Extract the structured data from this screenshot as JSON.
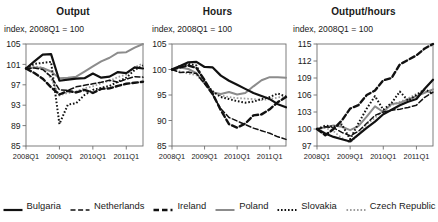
{
  "figure": {
    "subtitle_common": "index, 2008Q1 = 100",
    "xticks": [
      "2008Q1",
      "2009Q1",
      "2010Q1",
      "2011Q1"
    ]
  },
  "legend": {
    "items": [
      {
        "label": "Bulgaria",
        "style": "solid",
        "color": "#111111",
        "width": 2.2
      },
      {
        "label": "Netherlands",
        "style": "dashed",
        "color": "#111111",
        "width": 1.5
      },
      {
        "label": "Ireland",
        "style": "dashed-bold",
        "color": "#111111",
        "width": 2.4
      },
      {
        "label": "Poland",
        "style": "solid",
        "color": "#8c8c8c",
        "width": 2.0
      },
      {
        "label": "Slovakia",
        "style": "dotted",
        "color": "#111111",
        "width": 2.0
      },
      {
        "label": "Czech Republic",
        "style": "dotted",
        "color": "#9e9e9e",
        "width": 1.8
      }
    ]
  },
  "chart_data": [
    {
      "type": "line",
      "title": "Output",
      "subtitle": "index, 2008Q1 = 100",
      "xlabel": "",
      "ylabel": "",
      "ylim": [
        85,
        105
      ],
      "yticks": [
        85,
        89,
        93,
        97,
        101,
        105
      ],
      "grid": false,
      "legend_position": "bottom-figure",
      "x": [
        "2008Q1",
        "2008Q2",
        "2008Q3",
        "2008Q4",
        "2009Q1",
        "2009Q2",
        "2009Q3",
        "2009Q4",
        "2010Q1",
        "2010Q2",
        "2010Q3",
        "2010Q4",
        "2011Q1",
        "2011Q2",
        "2011Q3"
      ],
      "series": [
        {
          "name": "Bulgaria",
          "values": [
            100.2,
            101.6,
            102.9,
            103.0,
            97.8,
            98.0,
            98.2,
            98.3,
            99.2,
            98.4,
            98.6,
            99.5,
            99.3,
            100.4,
            100.2
          ]
        },
        {
          "name": "Netherlands",
          "values": [
            100.2,
            100.3,
            100.0,
            98.6,
            96.0,
            95.9,
            96.6,
            96.9,
            97.2,
            97.5,
            97.9,
            97.5,
            98.1,
            98.6,
            98.5
          ]
        },
        {
          "name": "Ireland",
          "values": [
            100.2,
            99.3,
            98.2,
            96.5,
            95.1,
            95.8,
            95.5,
            96.0,
            95.4,
            96.2,
            96.3,
            96.8,
            97.2,
            97.4,
            97.6
          ]
        },
        {
          "name": "Poland",
          "values": [
            100.2,
            100.4,
            100.3,
            99.6,
            98.3,
            98.4,
            98.6,
            99.6,
            100.6,
            101.6,
            102.3,
            103.3,
            103.4,
            104.3,
            105.0
          ]
        },
        {
          "name": "Slovakia",
          "values": [
            100.2,
            101.1,
            101.3,
            101.5,
            89.3,
            93.1,
            93.4,
            95.0,
            96.0,
            96.4,
            96.8,
            97.6,
            98.4,
            99.9,
            100.8
          ]
        },
        {
          "name": "Czech Republic",
          "values": [
            100.2,
            100.6,
            100.4,
            98.2,
            94.9,
            95.4,
            95.7,
            96.3,
            96.7,
            97.3,
            97.8,
            98.5,
            99.0,
            100.4,
            101.2
          ]
        }
      ]
    },
    {
      "type": "line",
      "title": "Hours",
      "subtitle": "index, 2008Q1 = 100",
      "xlabel": "",
      "ylabel": "",
      "ylim": [
        85,
        105
      ],
      "yticks": [
        85,
        90,
        95,
        100,
        105
      ],
      "grid": false,
      "legend_position": "bottom-figure",
      "x": [
        "2008Q1",
        "2008Q2",
        "2008Q3",
        "2008Q4",
        "2009Q1",
        "2009Q2",
        "2009Q3",
        "2009Q4",
        "2010Q1",
        "2010Q2",
        "2010Q3",
        "2010Q4",
        "2011Q1",
        "2011Q2",
        "2011Q3"
      ],
      "series": [
        {
          "name": "Bulgaria",
          "values": [
            100.0,
            100.7,
            101.4,
            101.5,
            100.5,
            100.4,
            98.8,
            97.8,
            97.0,
            96.2,
            95.4,
            94.8,
            94.2,
            93.2,
            92.6
          ]
        },
        {
          "name": "Netherlands",
          "values": [
            100.0,
            99.4,
            99.5,
            99.2,
            97.2,
            95.0,
            92.3,
            90.6,
            89.9,
            89.2,
            88.5,
            88.0,
            87.5,
            86.8,
            86.3
          ]
        },
        {
          "name": "Ireland",
          "values": [
            100.0,
            100.4,
            100.8,
            100.3,
            97.9,
            95.2,
            92.0,
            89.3,
            88.6,
            89.4,
            91.0,
            91.2,
            92.2,
            93.6,
            94.6
          ]
        },
        {
          "name": "Poland",
          "values": [
            100.0,
            100.4,
            100.1,
            99.3,
            97.3,
            95.5,
            95.2,
            95.6,
            95.1,
            95.4,
            96.7,
            97.9,
            98.5,
            98.5,
            98.4
          ]
        },
        {
          "name": "Slovakia",
          "values": [
            100.0,
            100.7,
            101.1,
            100.8,
            97.5,
            95.7,
            94.6,
            94.2,
            93.8,
            93.5,
            93.7,
            94.2,
            94.6,
            95.3,
            94.7
          ]
        },
        {
          "name": "Czech Republic",
          "values": [
            100.0,
            99.6,
            99.2,
            98.9,
            97.3,
            95.6,
            94.9,
            94.6,
            94.4,
            94.3,
            94.2,
            94.0,
            94.2,
            94.5,
            94.8
          ]
        }
      ]
    },
    {
      "type": "line",
      "title": "Output/hours",
      "subtitle": "index, 2008Q1 = 100",
      "xlabel": "",
      "ylabel": "",
      "ylim": [
        97,
        115
      ],
      "yticks": [
        97,
        100,
        103,
        106,
        109,
        112,
        115
      ],
      "grid": false,
      "legend_position": "bottom-figure",
      "x": [
        "2008Q1",
        "2008Q2",
        "2008Q3",
        "2008Q4",
        "2009Q1",
        "2009Q2",
        "2009Q3",
        "2009Q4",
        "2010Q1",
        "2010Q2",
        "2010Q3",
        "2010Q4",
        "2011Q1",
        "2011Q2",
        "2011Q3"
      ],
      "series": [
        {
          "name": "Bulgaria",
          "values": [
            100.0,
            99.2,
            98.6,
            98.2,
            97.8,
            99.0,
            100.2,
            101.3,
            102.6,
            103.4,
            104.2,
            104.8,
            105.3,
            107.1,
            108.7
          ]
        },
        {
          "name": "Netherlands",
          "values": [
            100.0,
            100.4,
            100.2,
            99.4,
            98.8,
            99.6,
            101.0,
            102.4,
            103.0,
            103.3,
            103.5,
            103.8,
            104.2,
            105.6,
            106.5
          ]
        },
        {
          "name": "Ireland",
          "values": [
            100.0,
            98.9,
            100.0,
            101.5,
            103.6,
            104.2,
            106.0,
            106.8,
            108.6,
            109.0,
            111.4,
            112.2,
            113.0,
            114.2,
            115.0
          ]
        },
        {
          "name": "Poland",
          "values": [
            100.0,
            100.3,
            100.6,
            100.4,
            99.8,
            100.5,
            102.2,
            104.0,
            103.0,
            104.4,
            104.6,
            105.2,
            105.8,
            106.4,
            107.0
          ]
        },
        {
          "name": "Slovakia",
          "values": [
            100.0,
            100.6,
            100.4,
            100.8,
            98.2,
            101.0,
            103.6,
            105.8,
            103.4,
            104.6,
            106.6,
            105.0,
            106.0,
            107.0,
            106.2
          ]
        },
        {
          "name": "Czech Republic",
          "values": [
            100.0,
            100.2,
            99.6,
            98.4,
            97.6,
            99.0,
            100.8,
            102.0,
            103.2,
            104.2,
            104.8,
            105.4,
            106.2,
            106.6,
            106.4
          ]
        }
      ]
    }
  ]
}
